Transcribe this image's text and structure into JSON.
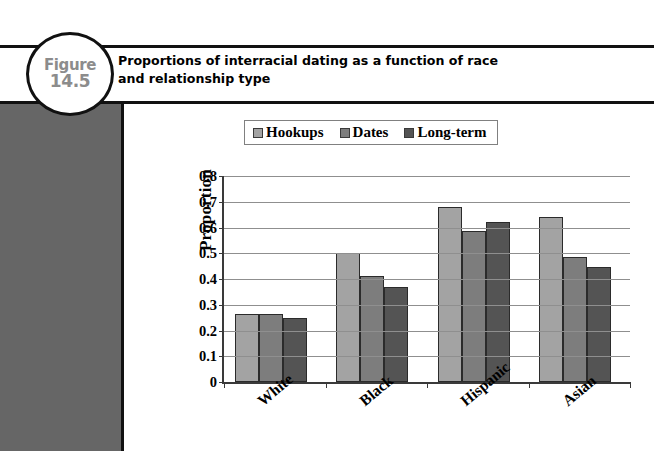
{
  "figure": {
    "badge_word": "Figure",
    "badge_number": "14.5",
    "title_line1": "Proportions of interracial dating as a function of race",
    "title_line2": "and relationship type"
  },
  "chart_data": {
    "type": "bar",
    "title": "",
    "xlabel": "",
    "ylabel": "Proportion",
    "ylim": [
      0,
      0.8
    ],
    "ytick_labels": [
      "0.8",
      "0.7",
      "0.6",
      "0.5",
      "0.4",
      "0.3",
      "0.2",
      "0.1",
      "0"
    ],
    "ytick_values": [
      0.8,
      0.7,
      0.6,
      0.5,
      0.4,
      0.3,
      0.2,
      0.1,
      0
    ],
    "grid": true,
    "legend_position": "top-center",
    "categories": [
      "White",
      "Black",
      "Hispanic",
      "Asian"
    ],
    "series": [
      {
        "name": "Hookups",
        "color": "#a3a3a3",
        "values": [
          0.265,
          0.5,
          0.68,
          0.64
        ]
      },
      {
        "name": "Dates",
        "color": "#7d7d7d",
        "values": [
          0.265,
          0.41,
          0.585,
          0.485
        ]
      },
      {
        "name": "Long-term",
        "color": "#545454",
        "values": [
          0.25,
          0.37,
          0.62,
          0.445
        ]
      }
    ]
  },
  "colors": {
    "panel_gray": "#666666",
    "rule_black": "#111111",
    "badge_text_gray": "#8c8c8c"
  }
}
